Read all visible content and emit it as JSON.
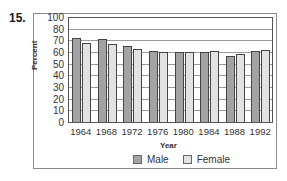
{
  "question_number": "15.",
  "chart_data": {
    "type": "bar",
    "title": "",
    "xlabel": "Year",
    "ylabel": "Percent",
    "categories": [
      "1964",
      "1968",
      "1972",
      "1976",
      "1980",
      "1984",
      "1988",
      "1992"
    ],
    "series": [
      {
        "name": "Male",
        "color": "#a3a3a3",
        "values": [
          72,
          71,
          65,
          61,
          60,
          60,
          57,
          61
        ]
      },
      {
        "name": "Female",
        "color": "#e2e2e2",
        "values": [
          68,
          67,
          63,
          60,
          60,
          61,
          58,
          62
        ]
      }
    ],
    "ytick_labels": [
      "100",
      "80",
      "70",
      "60",
      "50",
      "40",
      "30",
      "20",
      "10",
      "0"
    ],
    "ytick_positions": [
      90,
      80,
      70,
      60,
      50,
      40,
      30,
      20,
      10,
      0
    ],
    "ylim": [
      0,
      90
    ],
    "grid": true,
    "legend_position": "bottom"
  }
}
